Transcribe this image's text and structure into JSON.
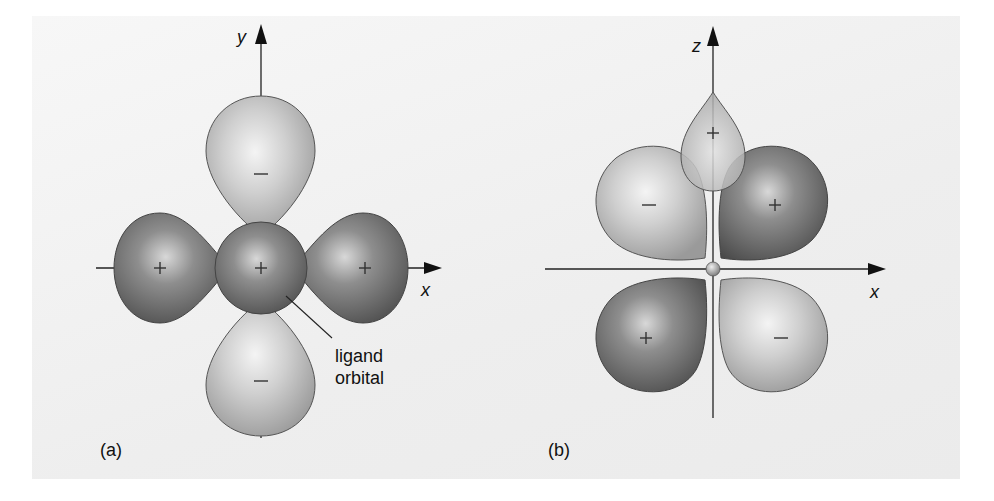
{
  "figure_a": {
    "label": "(a)",
    "axis_x": "x",
    "axis_y": "y",
    "annotation_line1": "ligand",
    "annotation_line2": "orbital",
    "lobes": [
      {
        "position": "top",
        "sign": "−",
        "shade": "light"
      },
      {
        "position": "bottom",
        "sign": "−",
        "shade": "light"
      },
      {
        "position": "left",
        "sign": "+",
        "shade": "dark"
      },
      {
        "position": "right",
        "sign": "+",
        "shade": "dark"
      },
      {
        "position": "center",
        "sign": "+",
        "shade": "dark",
        "role": "ligand orbital"
      }
    ]
  },
  "figure_b": {
    "label": "(b)",
    "axis_x": "x",
    "axis_z": "z",
    "lobes": [
      {
        "position": "top-center",
        "sign": "+",
        "shape": "teardrop",
        "shade": "light"
      },
      {
        "position": "upper-left",
        "sign": "−",
        "shade": "light"
      },
      {
        "position": "upper-right",
        "sign": "+",
        "shade": "dark"
      },
      {
        "position": "lower-left",
        "sign": "+",
        "shade": "dark"
      },
      {
        "position": "lower-right",
        "sign": "−",
        "shade": "light"
      }
    ]
  },
  "colors": {
    "light_lobe": "#c9c9c9",
    "dark_lobe": "#6f6f6f",
    "panel": "#efefef",
    "axis": "#222222"
  }
}
